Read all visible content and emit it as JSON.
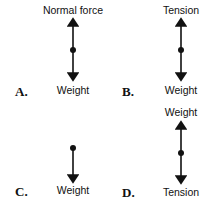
{
  "diagrams": [
    {
      "letter": "A.",
      "top_label": "Normal force",
      "bottom_label": "Weight"
    },
    {
      "letter": "B.",
      "top_label": "Tension",
      "bottom_label": "Weight"
    },
    {
      "letter": "C.",
      "top_label": "",
      "bottom_label": "Weight"
    },
    {
      "letter": "D.",
      "top_label": "Weight",
      "bottom_label": "Tension"
    }
  ]
}
